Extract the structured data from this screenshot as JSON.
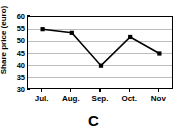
{
  "chart_data": {
    "type": "line",
    "title": "",
    "caption": "C",
    "xlabel": "",
    "ylabel": "Share price (euro)",
    "categories": [
      "Jul.",
      "Aug.",
      "Sep.",
      "Oct.",
      "Nov"
    ],
    "values": [
      55,
      53.5,
      40,
      51.8,
      45
    ],
    "series": [
      {
        "name": "Share price",
        "values": [
          55,
          53.5,
          40,
          51.8,
          45
        ],
        "color": "#000000",
        "marker": "square"
      }
    ],
    "ylim": [
      30,
      60
    ],
    "yticks": [
      30,
      35,
      40,
      45,
      50,
      55,
      60
    ],
    "ytick_labels": [
      "30",
      "35",
      "40",
      "45",
      "50",
      "55",
      "60"
    ],
    "xtick_labels": [
      "Jul.",
      "Aug.",
      "Sep.",
      "Oct.",
      "Nov"
    ],
    "grid": "horizontal",
    "grid_color": "#bdbdbd",
    "legend": "none",
    "frame": "box",
    "frame_color": "#000000",
    "background": "#ffffff"
  }
}
